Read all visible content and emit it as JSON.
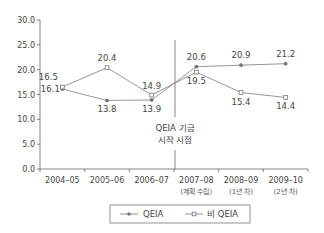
{
  "chart_data": {
    "type": "line",
    "title": "",
    "xlabel": "",
    "ylabel": "",
    "ylim": [
      0,
      30
    ],
    "yticks": [
      "30.0",
      "25.0",
      "20.0",
      "15.0",
      "10.0",
      "5.0",
      "0.0"
    ],
    "grid": false,
    "legend_position": "bottom",
    "categories": [
      "2004–05",
      "2005–06",
      "2006–07",
      "2007–08",
      "2008–09",
      "2009–10"
    ],
    "category_sublabels": [
      "",
      "",
      "",
      "(계획 수립)",
      "(1년 차)",
      "(2년 차)"
    ],
    "series": [
      {
        "name": "QEIA",
        "marker": "filled-circle",
        "values": [
          16.1,
          13.8,
          13.9,
          20.6,
          20.9,
          21.2
        ],
        "labels": [
          "16.1",
          "13.8",
          "13.9",
          "20.6",
          "20.9",
          "21.2"
        ]
      },
      {
        "name": "비 QEIA",
        "marker": "hollow-square",
        "values": [
          16.5,
          20.4,
          14.9,
          19.5,
          15.4,
          14.4
        ],
        "labels": [
          "16.5",
          "20.4",
          "14.9",
          "19.5",
          "15.4",
          "14.4"
        ]
      }
    ],
    "annotations": [
      {
        "text_line1": "QEIA 기금",
        "text_line2": "시작 시점",
        "x_position": "between 2006–07 and 2007–08"
      }
    ]
  },
  "colors": {
    "line": "#8a8a8a",
    "axis": "#555555",
    "text": "#444444"
  }
}
